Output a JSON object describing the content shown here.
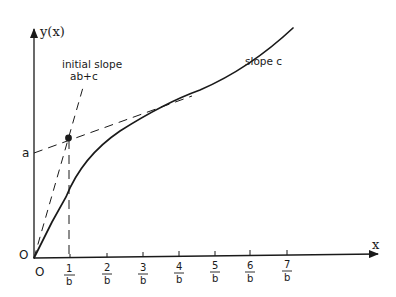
{
  "diagram": {
    "y_axis_label": "y(x)",
    "x_axis_label": "x",
    "origin_label_y": "O",
    "origin_label_x": "O",
    "intercept_label": "a",
    "initial_slope_label_line1": "initial slope",
    "initial_slope_label_line2": "ab+c",
    "asymptote_label": "slope c",
    "x_ticks": [
      {
        "num": "1",
        "den": "b"
      },
      {
        "num": "2",
        "den": "b"
      },
      {
        "num": "3",
        "den": "b"
      },
      {
        "num": "4",
        "den": "b"
      },
      {
        "num": "5",
        "den": "b"
      },
      {
        "num": "6",
        "den": "b"
      },
      {
        "num": "7",
        "den": "b"
      }
    ]
  },
  "colors": {
    "ink": "#1a1a1a",
    "background": "#ffffff"
  }
}
